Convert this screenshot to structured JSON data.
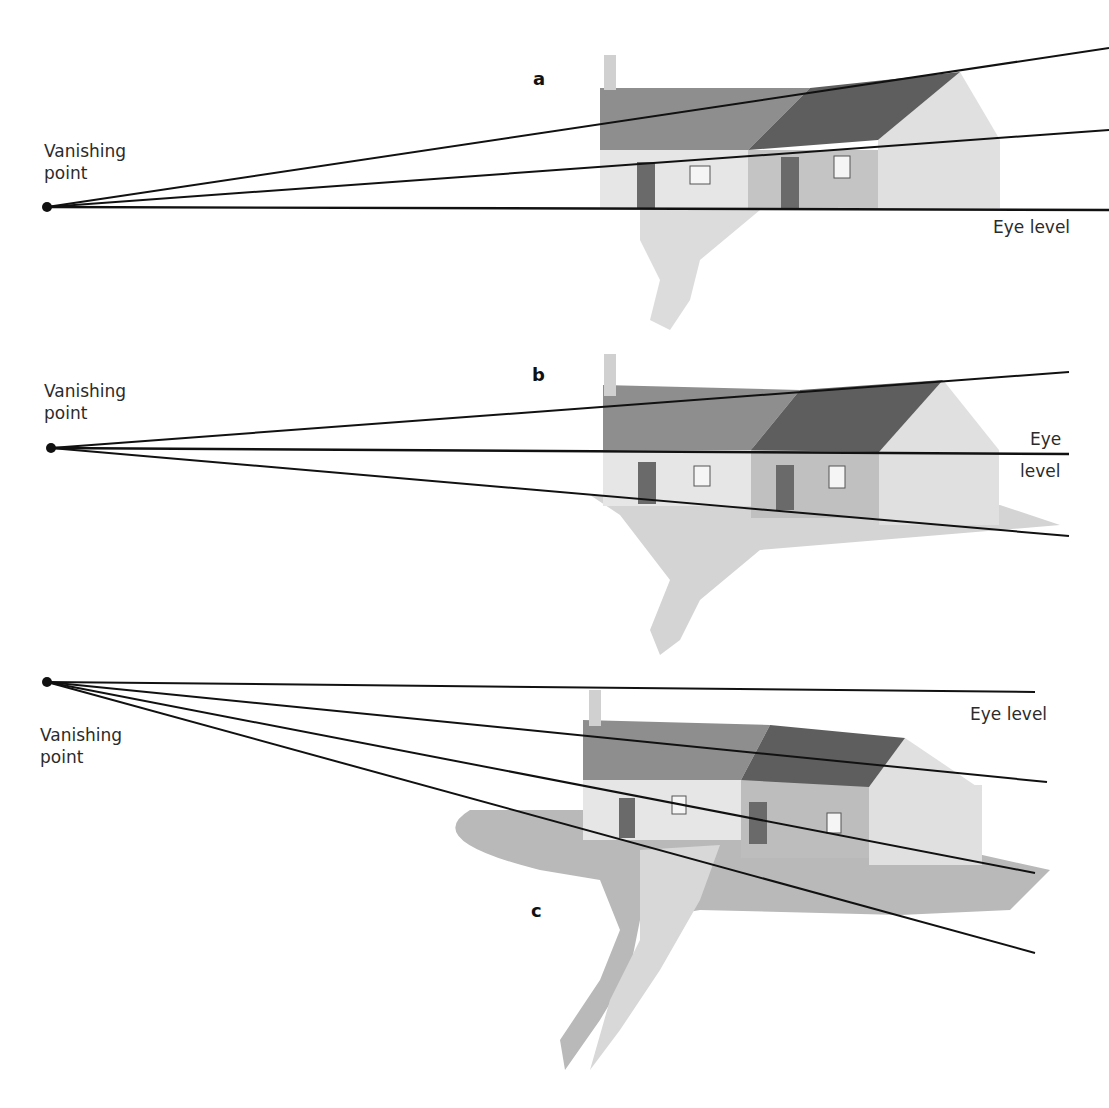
{
  "figure": {
    "colors": {
      "line": "#111111",
      "roof_light": "#8c8c8c",
      "roof_dark": "#5e5e5e",
      "wall_light": "#e3e3e3",
      "wall_mid": "#b5b5b5",
      "ground": "#c8c8c8",
      "path": "#dedede"
    },
    "panels": [
      {
        "id": "a",
        "letter": "a",
        "vanishing_label_line1": "Vanishing",
        "vanishing_label_line2": "point",
        "eye_level_label": "Eye level",
        "eye_level_line2": ""
      },
      {
        "id": "b",
        "letter": "b",
        "vanishing_label_line1": "Vanishing",
        "vanishing_label_line2": "point",
        "eye_level_label": "Eye",
        "eye_level_line2": "level"
      },
      {
        "id": "c",
        "letter": "c",
        "vanishing_label_line1": "Vanishing",
        "vanishing_label_line2": "point",
        "eye_level_label": "Eye level",
        "eye_level_line2": ""
      }
    ]
  }
}
